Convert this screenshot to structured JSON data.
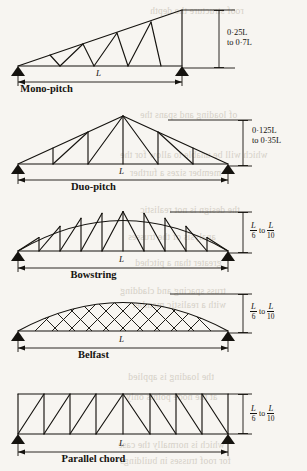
{
  "page": {
    "background": "#f7f5f1",
    "ink": "#15130f",
    "bleed_ink": "#cfcabf",
    "width": 307,
    "height": 471
  },
  "bleed_text": [
    {
      "text": "roof structure the depth",
      "x": 150,
      "y": 6
    },
    {
      "text": "of loading and spans the",
      "x": 140,
      "y": 110
    },
    {
      "text": "which will be unable to allow for the",
      "x": 120,
      "y": 150
    },
    {
      "text": "member sizes a further",
      "x": 130,
      "y": 168
    },
    {
      "text": "the design is not realistic",
      "x": 140,
      "y": 205
    },
    {
      "text": "analysis of the trusses",
      "x": 128,
      "y": 232
    },
    {
      "text": "greater than a pitched",
      "x": 135,
      "y": 258
    },
    {
      "text": "truss spacing and cladding",
      "x": 120,
      "y": 286
    },
    {
      "text": "with a realistic member",
      "x": 132,
      "y": 300
    },
    {
      "text": "the loading is applied",
      "x": 128,
      "y": 372
    },
    {
      "text": "at the node points only",
      "x": 126,
      "y": 392
    },
    {
      "text": "which is normally the case",
      "x": 118,
      "y": 440
    },
    {
      "text": "for roof trusses in buildings",
      "x": 120,
      "y": 456
    }
  ],
  "figures": [
    {
      "id": "mono-pitch",
      "caption": "Mono-pitch",
      "span_label": "L",
      "depth_note_lines": [
        "0·25L",
        "to 0·7L"
      ],
      "depth_note_plain": "0·25L to 0·7L",
      "depth_style": "text"
    },
    {
      "id": "duo-pitch",
      "caption": "Duo-pitch",
      "span_label": "L",
      "depth_note_lines": [
        "0·125L",
        "to 0·35L"
      ],
      "depth_note_plain": "0·125L to 0·35L",
      "depth_style": "text"
    },
    {
      "id": "bowstring",
      "caption": "Bowstring",
      "span_label": "L",
      "depth_fraction": {
        "numerator": "L",
        "denominator_1": "6",
        "connector": "to",
        "denominator_2": "10"
      },
      "depth_note_plain": "L/6 to L/10",
      "depth_style": "fraction"
    },
    {
      "id": "belfast",
      "caption": "Belfast",
      "span_label": "L",
      "depth_fraction": {
        "numerator": "L",
        "denominator_1": "6",
        "connector": "to",
        "denominator_2": "10"
      },
      "depth_note_plain": "L/6 to L/10",
      "depth_style": "fraction"
    },
    {
      "id": "parallel-chord",
      "caption": "Parallel chord",
      "span_label": "L",
      "depth_fraction": {
        "numerator": "L",
        "denominator_1": "6",
        "connector": "to",
        "denominator_2": "10"
      },
      "depth_note_plain": "L/6 to L/10",
      "depth_style": "fraction"
    }
  ]
}
